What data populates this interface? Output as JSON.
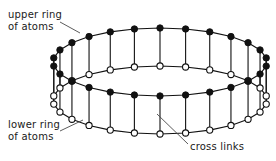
{
  "figure": {
    "type": "molecular-ring-diagram",
    "background_color": "#ffffff",
    "line_color": "#111111",
    "leader_color": "#4a4a4a",
    "width": 276,
    "height": 161
  },
  "labels": {
    "upper_ring": {
      "line1": "upper ring",
      "line2": "of atoms",
      "x": 8,
      "y": 18
    },
    "lower_ring": {
      "line1": "lower ring",
      "line2": "of atoms",
      "x": 8,
      "y": 128
    },
    "cross_links": {
      "line1": "cross links",
      "x": 190,
      "y": 150
    }
  },
  "geometry": {
    "center_x": 160,
    "center_y": 62,
    "radius_x": 107,
    "radius_y": 34,
    "ring_separation": 38,
    "node_count": 26,
    "upper_node_radius": 3.2,
    "lower_node_radius": 3.1,
    "upper_node_style": "filled",
    "lower_node_style": "open"
  },
  "legend": {
    "upper_marker": "filled-circle",
    "lower_marker": "open-circle",
    "link_marker": "vertical-line"
  }
}
